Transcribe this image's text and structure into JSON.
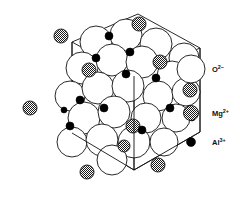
{
  "figure": {
    "name": "spinel-crystal-structure",
    "background_color": "#ffffff",
    "line_color": "#111111",
    "cell": {
      "name": "unit-cell-parallelepiped",
      "stroke": "#111111",
      "stroke_width": 0.9,
      "outline_points": "72,42 138,14 200,48 200,132 134,170 72,133",
      "top_face_points": "72,42 138,14 200,48 134,76",
      "vertical_edges": [
        "72,42 72,133",
        "200,48 200,132",
        "134,76 134,170"
      ],
      "interior_edges": [
        "72,42 134,76",
        "134,76 200,48"
      ]
    }
  },
  "species": {
    "oxygen": {
      "symbol_key": "oxygen-ion",
      "label_base": "O",
      "label_sup": "2−",
      "label_full": "O2−",
      "fill": "#ffffff",
      "stroke": "#111111",
      "radius_px": 16
    },
    "magnesium": {
      "symbol_key": "magnesium-ion",
      "label_base": "Mg",
      "label_sup": "2+",
      "label_full": "Mg2+",
      "fill": "checker-hatch",
      "stroke": "#111111",
      "radius_px": 7
    },
    "aluminium": {
      "symbol_key": "aluminium-ion",
      "label_base": "Al",
      "label_sup": "3+",
      "label_full": "Al3+",
      "fill": "#000000",
      "stroke": "#000000",
      "radius_px": 4
    }
  },
  "atoms": {
    "oxygen_positions": [
      {
        "cx": 96,
        "cy": 42,
        "r": 16
      },
      {
        "cx": 126,
        "cy": 35,
        "r": 16
      },
      {
        "cx": 156,
        "cy": 44,
        "r": 16
      },
      {
        "cx": 184,
        "cy": 58,
        "r": 15
      },
      {
        "cx": 82,
        "cy": 68,
        "r": 16
      },
      {
        "cx": 112,
        "cy": 60,
        "r": 16
      },
      {
        "cx": 142,
        "cy": 62,
        "r": 16
      },
      {
        "cx": 172,
        "cy": 76,
        "r": 15
      },
      {
        "cx": 70,
        "cy": 96,
        "r": 15
      },
      {
        "cx": 98,
        "cy": 88,
        "r": 16
      },
      {
        "cx": 128,
        "cy": 86,
        "r": 16
      },
      {
        "cx": 158,
        "cy": 96,
        "r": 15
      },
      {
        "cx": 186,
        "cy": 92,
        "r": 14
      },
      {
        "cx": 84,
        "cy": 118,
        "r": 16
      },
      {
        "cx": 114,
        "cy": 112,
        "r": 16
      },
      {
        "cx": 146,
        "cy": 118,
        "r": 15
      },
      {
        "cx": 176,
        "cy": 118,
        "r": 14
      },
      {
        "cx": 72,
        "cy": 142,
        "r": 15
      },
      {
        "cx": 102,
        "cy": 140,
        "r": 16
      },
      {
        "cx": 134,
        "cy": 142,
        "r": 16
      },
      {
        "cx": 164,
        "cy": 142,
        "r": 14
      },
      {
        "cx": 112,
        "cy": 160,
        "r": 15
      }
    ],
    "magnesium_positions": [
      {
        "cx": 61,
        "cy": 36,
        "r": 7
      },
      {
        "cx": 139,
        "cy": 24,
        "r": 7
      },
      {
        "cx": 89,
        "cy": 70,
        "r": 7
      },
      {
        "cx": 160,
        "cy": 62,
        "r": 7
      },
      {
        "cx": 30,
        "cy": 108,
        "r": 7
      },
      {
        "cx": 190,
        "cy": 90,
        "r": 7
      },
      {
        "cx": 133,
        "cy": 126,
        "r": 7
      },
      {
        "cx": 124,
        "cy": 146,
        "r": 6
      },
      {
        "cx": 87,
        "cy": 172,
        "r": 7
      },
      {
        "cx": 158,
        "cy": 165,
        "r": 7
      }
    ],
    "aluminium_positions": [
      {
        "cx": 109,
        "cy": 36,
        "r": 4
      },
      {
        "cx": 130,
        "cy": 52,
        "r": 4
      },
      {
        "cx": 96,
        "cy": 58,
        "r": 4
      },
      {
        "cx": 126,
        "cy": 74,
        "r": 4
      },
      {
        "cx": 156,
        "cy": 78,
        "r": 4
      },
      {
        "cx": 104,
        "cy": 108,
        "r": 4
      },
      {
        "cx": 80,
        "cy": 100,
        "r": 4
      },
      {
        "cx": 70,
        "cy": 126,
        "r": 4
      },
      {
        "cx": 64,
        "cy": 110,
        "r": 3
      },
      {
        "cx": 170,
        "cy": 108,
        "r": 4
      },
      {
        "cx": 142,
        "cy": 130,
        "r": 4
      },
      {
        "cx": 192,
        "cy": 118,
        "r": 3
      }
    ]
  },
  "legend": {
    "name": "ion-legend",
    "items": [
      {
        "key": "oxygen-ion",
        "symbol": "open-circle",
        "cx": 191,
        "cy": 69,
        "r": 14,
        "label_x": 212,
        "label_y": 72,
        "base": "O",
        "sup": "2−"
      },
      {
        "key": "magnesium-ion",
        "symbol": "hatched-circle",
        "cx": 191,
        "cy": 113,
        "r": 7.5,
        "label_x": 212,
        "label_y": 116,
        "base": "Mg",
        "sup": "2+"
      },
      {
        "key": "aluminium-ion",
        "symbol": "filled-circle",
        "cx": 191,
        "cy": 142,
        "r": 4.5,
        "label_x": 212,
        "label_y": 145,
        "base": "Al",
        "sup": "3+"
      }
    ]
  }
}
